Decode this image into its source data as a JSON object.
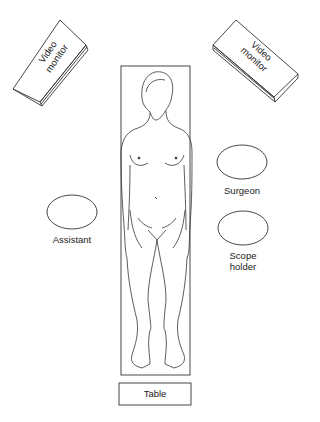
{
  "diagram": {
    "type": "operating-room-layout",
    "elements": {
      "monitor_left": {
        "label_line1": "Video",
        "label_line2": "monitor"
      },
      "monitor_right": {
        "label_line1": "Video",
        "label_line2": "monitor"
      },
      "surgeon": {
        "label": "Surgeon"
      },
      "scope_holder": {
        "label_line1": "Scope",
        "label_line2": "holder"
      },
      "assistant": {
        "label": "Assistant"
      },
      "table": {
        "label": "Table"
      },
      "patient": {
        "description": "supine patient figure on table"
      }
    },
    "colors": {
      "line": "#333333",
      "background": "#ffffff"
    }
  }
}
